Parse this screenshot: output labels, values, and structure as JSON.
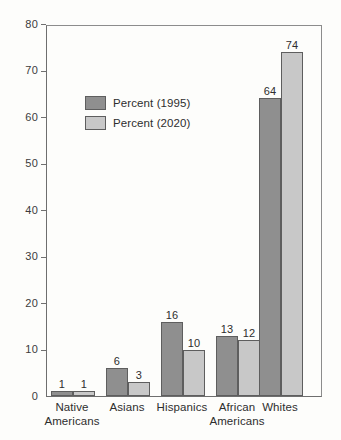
{
  "chart_data": {
    "type": "bar",
    "title": "",
    "subtitle": "",
    "xlabel": "",
    "ylabel": "",
    "ylim": [
      0,
      80
    ],
    "ytick_labels": [
      "0",
      "10",
      "20",
      "30",
      "40",
      "50",
      "60",
      "70",
      "80"
    ],
    "ytick_values": [
      0,
      10,
      20,
      30,
      40,
      50,
      60,
      70,
      80
    ],
    "grid": false,
    "legend_position": "upper-left-inside",
    "categories": [
      "Native\nAmericans",
      "Asians",
      "Hispanics",
      "African\nAmericans",
      "Whites"
    ],
    "series": [
      {
        "name": "Percent (1995)",
        "color": "#8f8f8f",
        "values": [
          1,
          6,
          16,
          13,
          64
        ],
        "labels": [
          "1",
          "6",
          "16",
          "13",
          "64"
        ]
      },
      {
        "name": "Percent (2020)",
        "color": "#c8c8c8",
        "values": [
          1,
          3,
          10,
          12,
          74
        ],
        "labels": [
          "1",
          "3",
          "10",
          "12",
          "74"
        ]
      }
    ]
  },
  "legend": {
    "entries": [
      {
        "label": "Percent (1995)",
        "swatch_color": "#8f8f8f"
      },
      {
        "label": "Percent (2020)",
        "swatch_color": "#c8c8c8"
      }
    ]
  },
  "axis": {
    "y_ticks": [
      {
        "label": "80",
        "value": 80
      },
      {
        "label": "70",
        "value": 70
      },
      {
        "label": "60",
        "value": 60
      },
      {
        "label": "50",
        "value": 50
      },
      {
        "label": "40",
        "value": 40
      },
      {
        "label": "30",
        "value": 30
      },
      {
        "label": "20",
        "value": 20
      },
      {
        "label": "10",
        "value": 10
      },
      {
        "label": "0",
        "value": 0
      }
    ]
  },
  "colors": {
    "series_1995": "#8f8f8f",
    "series_2020": "#c8c8c8",
    "bar_outline": "#5e5e5e",
    "axis": "#6e6e6e",
    "text": "#2e2e2e",
    "background": "#fdfdfb"
  }
}
